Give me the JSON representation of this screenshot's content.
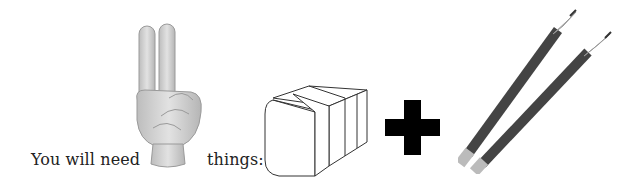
{
  "sentence": {
    "before": "You will need",
    "after": "things:"
  },
  "icons": {
    "number": "two-fingers-hand-icon",
    "item1": "eraser-icon",
    "operator": "plus-icon",
    "item2": "two-pencils-icon"
  },
  "colors": {
    "text": "#222222",
    "plus": "#000000",
    "pencil_body": "#4a4a4a",
    "hand": "#c8c8c8"
  }
}
